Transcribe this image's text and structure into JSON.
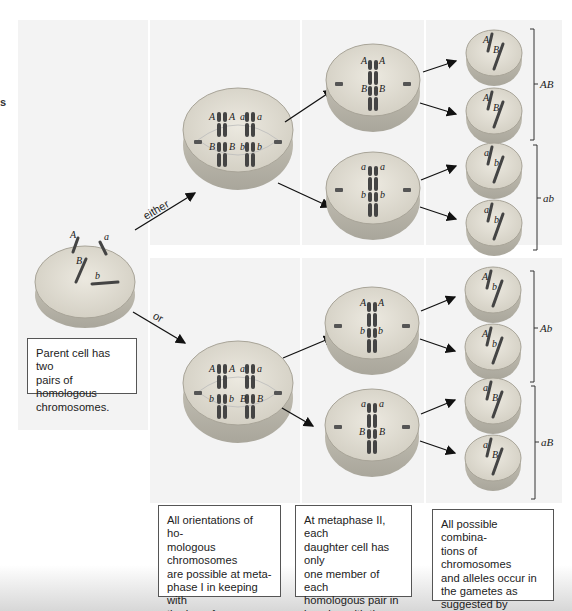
{
  "stray_text": "s",
  "branch_labels": {
    "either": "either",
    "or": "or"
  },
  "parent_cell": {
    "alleles": [
      "A",
      "a",
      "B",
      "b"
    ],
    "caption": "Parent cell has two\npairs of homologous\nchromosomes."
  },
  "metaphase_I": {
    "top": {
      "alleles": [
        "A",
        "A",
        "a",
        "a",
        "B",
        "B",
        "b",
        "b"
      ]
    },
    "bottom": {
      "alleles": [
        "A",
        "A",
        "a",
        "a",
        "b",
        "b",
        "B",
        "B"
      ]
    },
    "caption": "All orientations of ho-\nmologous chromosomes\nare possible at meta-\nphase I in keeping with\nthe law of independent\nassortment."
  },
  "metaphase_II": {
    "cells": [
      {
        "alleles": [
          "A",
          "A",
          "B",
          "B"
        ]
      },
      {
        "alleles": [
          "a",
          "a",
          "b",
          "b"
        ]
      },
      {
        "alleles": [
          "A",
          "A",
          "b",
          "b"
        ]
      },
      {
        "alleles": [
          "a",
          "a",
          "B",
          "B"
        ]
      }
    ],
    "caption": "At metaphase II, each\ndaughter cell has only\none member of each\nhomologous pair in\nkeeping with the law of\nsegregation."
  },
  "gametes": {
    "cells": [
      {
        "alleles": [
          "A",
          "B"
        ]
      },
      {
        "alleles": [
          "A",
          "B"
        ]
      },
      {
        "alleles": [
          "a",
          "b"
        ]
      },
      {
        "alleles": [
          "a",
          "b"
        ]
      },
      {
        "alleles": [
          "A",
          "b"
        ]
      },
      {
        "alleles": [
          "A",
          "b"
        ]
      },
      {
        "alleles": [
          "a",
          "B"
        ]
      },
      {
        "alleles": [
          "a",
          "B"
        ]
      }
    ],
    "group_labels": [
      "AB",
      "ab",
      "Ab",
      "aB"
    ],
    "caption": "All possible combina-\ntions of chromosomes\nand alleles occur in\nthe gametes as\nsuggested by Mendel's\ntwo laws."
  },
  "colors": {
    "panel_bg": "#f3f3f3",
    "cell_fill": "#ddd9cc",
    "cell_edge": "#9a978c",
    "chromosome": "#4a4a4a",
    "arrow": "#111111"
  }
}
